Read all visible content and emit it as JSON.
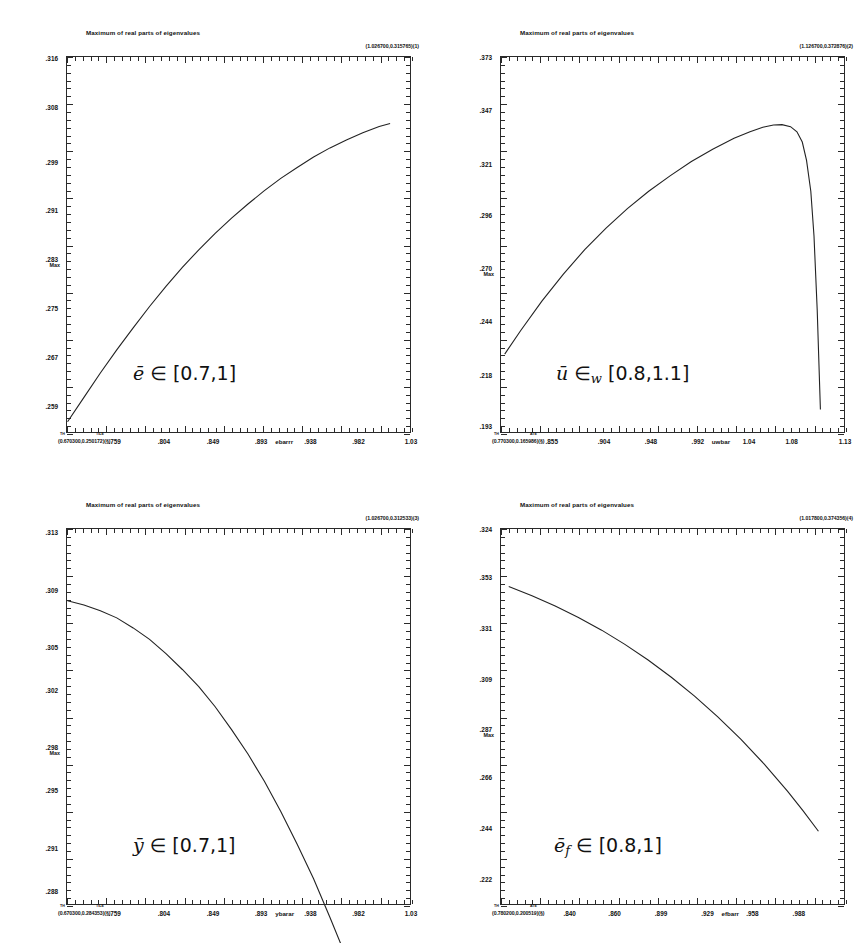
{
  "page": {
    "background": "#ffffff",
    "panel_count": 4
  },
  "chart_data": [
    {
      "id": "panel-ebar",
      "type": "line",
      "title": "Maximum of real parts of eigenvalues",
      "xlabel": "ebarrr",
      "ylabel": "Max",
      "corner_coord": "(1.026700,0.315765)(1)",
      "origin_coord": "(0.670300,0.250172)(§)",
      "origin_sup_left": "TH",
      "origin_sup_right": "TILE",
      "annotation": "ē ∈ [0.7,1]",
      "annotation_var": "e",
      "annotation_text": " ∈ [0.7,1]",
      "xticklabels": [
        ".759",
        ".804",
        ".849",
        ".893",
        ".938",
        ".982",
        "1.03"
      ],
      "xtickvalues": [
        0.759,
        0.804,
        0.849,
        0.893,
        0.938,
        0.982,
        1.03
      ],
      "yticklabels": [
        ".316",
        ".308",
        ".299",
        ".291",
        ".283",
        ".275",
        ".267",
        ".259"
      ],
      "ytickvalues": [
        0.316,
        0.308,
        0.299,
        0.291,
        0.283,
        0.275,
        0.267,
        0.259
      ],
      "xlim": [
        0.7145,
        1.03
      ],
      "ylim": [
        0.2545,
        0.3163
      ],
      "grid": false,
      "legend": "none",
      "x": [
        0.715,
        0.73,
        0.745,
        0.76,
        0.775,
        0.79,
        0.805,
        0.82,
        0.835,
        0.85,
        0.865,
        0.88,
        0.895,
        0.91,
        0.925,
        0.94,
        0.955,
        0.97,
        0.985,
        1.0,
        1.01
      ],
      "y": [
        0.2565,
        0.2605,
        0.2645,
        0.2683,
        0.2719,
        0.2754,
        0.2787,
        0.2818,
        0.2847,
        0.2874,
        0.2899,
        0.2922,
        0.2944,
        0.2964,
        0.2982,
        0.2999,
        0.3014,
        0.3027,
        0.3039,
        0.3049,
        0.3054
      ]
    },
    {
      "id": "panel-uwbar",
      "type": "line",
      "title": "Maximum of real parts of eigenvalues",
      "xlabel": "uwbar",
      "ylabel": "Max",
      "corner_coord": "(1.126700,0.372876)(2)",
      "origin_coord": "(0.770300,0.165986)(§)",
      "origin_sup_left": "TH",
      "origin_sup_right": "ATE",
      "annotation": "ū ∈w [0.8,1.1]",
      "annotation_var": "u",
      "annotation_text": " ∈",
      "annotation_sub": "w",
      "annotation_tail": " [0.8,1.1]",
      "xticklabels": [
        ".855",
        ".904",
        ".948",
        ".992",
        "1.04",
        "1.08",
        "1.13"
      ],
      "xtickvalues": [
        0.855,
        0.904,
        0.948,
        0.992,
        1.04,
        1.08,
        1.13
      ],
      "yticklabels": [
        ".373",
        ".347",
        ".321",
        ".296",
        ".270",
        ".244",
        ".218",
        ".193"
      ],
      "ytickvalues": [
        0.373,
        0.347,
        0.321,
        0.296,
        0.27,
        0.244,
        0.218,
        0.193
      ],
      "xlim": [
        0.8065,
        1.13
      ],
      "ylim": [
        0.1895,
        0.3735
      ],
      "grid": false,
      "legend": "none",
      "x": [
        0.81,
        0.825,
        0.845,
        0.865,
        0.885,
        0.905,
        0.925,
        0.945,
        0.965,
        0.985,
        1.005,
        1.025,
        1.04,
        1.052,
        1.062,
        1.07,
        1.078,
        1.084,
        1.089,
        1.093,
        1.097,
        1.1,
        1.103,
        1.106
      ],
      "y": [
        0.2285,
        0.24,
        0.2545,
        0.2675,
        0.2795,
        0.29,
        0.2995,
        0.308,
        0.3155,
        0.3225,
        0.3285,
        0.3338,
        0.337,
        0.3392,
        0.3403,
        0.3405,
        0.3395,
        0.337,
        0.332,
        0.323,
        0.308,
        0.286,
        0.25,
        0.2015
      ]
    },
    {
      "id": "panel-ybar",
      "type": "line",
      "title": "Maximum of real parts of eigenvalues",
      "xlabel": "ybarar",
      "ylabel": "Max",
      "corner_coord": "(1.026700,0.312533)(3)",
      "origin_coord": "(0.670300,0.284353)(§)",
      "origin_sup_left": "TH",
      "origin_sup_right": "TILE",
      "annotation": "ȳ ∈ [0.7,1]",
      "annotation_var": "y",
      "annotation_text": " ∈ [0.7,1]",
      "xticklabels": [
        ".759",
        ".804",
        ".849",
        ".893",
        ".938",
        ".982",
        "1.03"
      ],
      "xtickvalues": [
        0.759,
        0.804,
        0.849,
        0.893,
        0.938,
        0.982,
        1.03
      ],
      "yticklabels": [
        ".313",
        ".309",
        ".305",
        ".302",
        ".298",
        ".295",
        ".291",
        ".288"
      ],
      "ytickvalues": [
        0.313,
        0.309,
        0.305,
        0.302,
        0.298,
        0.295,
        0.291,
        0.288
      ],
      "xlim": [
        0.7145,
        1.03
      ],
      "ylim": [
        0.287,
        0.3133
      ],
      "grid": false,
      "legend": "none",
      "x": [
        0.715,
        0.73,
        0.745,
        0.76,
        0.775,
        0.79,
        0.805,
        0.82,
        0.835,
        0.85,
        0.865,
        0.88,
        0.895,
        0.91,
        0.925,
        0.94,
        0.955,
        0.97,
        0.985,
        1.0
      ],
      "y": [
        0.3083,
        0.308,
        0.3076,
        0.3071,
        0.3064,
        0.3056,
        0.3046,
        0.3035,
        0.3023,
        0.3009,
        0.2993,
        0.2976,
        0.2957,
        0.2936,
        0.2913,
        0.2889,
        0.2862,
        0.2834,
        0.2803,
        0.2771
      ]
    },
    {
      "id": "panel-efbar",
      "type": "line",
      "title": "Maximum of real parts of eigenvalues",
      "xlabel": "efbarr",
      "ylabel": "Max",
      "corner_coord": "(1.017800,0.374356)(4)",
      "origin_coord": "(0.780200,0.200519)(§)",
      "origin_sup_left": "TH",
      "origin_sup_right": "ATE",
      "annotation": "ēf ∈ [0.8,1]",
      "annotation_var": "e",
      "annotation_sub": "f",
      "annotation_text": " ∈ [0.8,1]",
      "xticklabels": [
        ".840",
        ".860",
        ".899",
        ".929",
        ".958",
        ".988"
      ],
      "xtickvalues": [
        0.84,
        0.869,
        0.899,
        0.929,
        0.958,
        0.988
      ],
      "yticklabels": [
        ".324",
        ".353",
        ".331",
        ".309",
        ".287",
        ".266",
        ".244",
        ".222"
      ],
      "ytickvalues": [
        0.374,
        0.353,
        0.331,
        0.309,
        0.287,
        0.266,
        0.244,
        0.222
      ],
      "xlim": [
        0.795,
        1.0178
      ],
      "ylim": [
        0.2105,
        0.3745
      ],
      "grid": false,
      "legend": "none",
      "x": [
        0.8,
        0.815,
        0.83,
        0.845,
        0.86,
        0.875,
        0.89,
        0.905,
        0.92,
        0.935,
        0.95,
        0.965,
        0.98,
        0.99,
        1.0
      ],
      "y": [
        0.3495,
        0.3455,
        0.341,
        0.336,
        0.3305,
        0.3243,
        0.3175,
        0.31,
        0.3018,
        0.2928,
        0.283,
        0.2722,
        0.2605,
        0.252,
        0.243
      ]
    }
  ]
}
